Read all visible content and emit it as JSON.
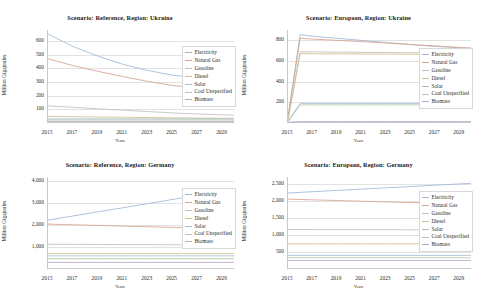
{
  "figure": {
    "xlabel": "Years",
    "ylabel": "Million Gigajoules",
    "xticks": [
      "2015",
      "2017",
      "2019",
      "2021",
      "2023",
      "2025",
      "2027",
      "2029"
    ],
    "legend": [
      {
        "label": "Electricity",
        "color": "#9fb8d8"
      },
      {
        "label": "Natural Gas",
        "color": "#d8a48c"
      },
      {
        "label": "Gasoline",
        "color": "#bfbfbf"
      },
      {
        "label": "Diesel",
        "color": "#cfc08a"
      },
      {
        "label": "Solar",
        "color": "#a8bcd0"
      },
      {
        "label": "Coal Unspecified",
        "color": "#b0c9a8"
      },
      {
        "label": "Biomass",
        "color": "#b9a9c9"
      }
    ]
  },
  "charts": [
    {
      "title": "Scenario: Reference, Region: Ukraine",
      "yticks": [
        "100",
        "200",
        "300",
        "400",
        "500",
        "600"
      ]
    },
    {
      "title": "Scenario: European, Region: Ukraine",
      "yticks": [
        "200",
        "400",
        "600",
        "800"
      ]
    },
    {
      "title": "Scenario: Reference, Region: Germany",
      "yticks": [
        "1,000",
        "2,000",
        "3,000",
        "4,000"
      ]
    },
    {
      "title": "Scenario: European, Region: Germany",
      "yticks": [
        "500",
        "1,000",
        "1,500",
        "2,000",
        "2,500"
      ]
    }
  ],
  "chart_data": [
    {
      "type": "line",
      "title": "Scenario: Reference, Region: Ukraine",
      "xlabel": "Years",
      "ylabel": "Million Gigajoules",
      "x": [
        2015,
        2017,
        2019,
        2021,
        2023,
        2025,
        2027,
        2029,
        2030
      ],
      "ylim": [
        0,
        680
      ],
      "yticks": [
        100,
        200,
        300,
        400,
        500,
        600
      ],
      "grid": true,
      "legend_position": "right",
      "series": [
        {
          "name": "Electricity",
          "values": [
            650,
            560,
            490,
            430,
            385,
            350,
            330,
            318,
            315
          ]
        },
        {
          "name": "Natural Gas",
          "values": [
            470,
            420,
            378,
            340,
            305,
            275,
            258,
            248,
            245
          ]
        },
        {
          "name": "Gasoline",
          "values": [
            125,
            115,
            104,
            94,
            84,
            74,
            66,
            60,
            58
          ]
        },
        {
          "name": "Diesel",
          "values": [
            48,
            46,
            44,
            42,
            40,
            38,
            36,
            35,
            35
          ]
        },
        {
          "name": "Solar",
          "values": [
            30,
            30,
            30,
            30,
            30,
            30,
            30,
            30,
            30
          ]
        },
        {
          "name": "Coal Unspecified",
          "values": [
            22,
            22,
            22,
            22,
            22,
            22,
            22,
            22,
            22
          ]
        },
        {
          "name": "Biomass",
          "values": [
            12,
            12,
            12,
            12,
            12,
            12,
            12,
            12,
            12
          ]
        }
      ]
    },
    {
      "type": "line",
      "title": "Scenario: European, Region: Ukraine",
      "xlabel": "Years",
      "ylabel": "Million Gigajoules",
      "x": [
        2015,
        2016,
        2017,
        2019,
        2021,
        2023,
        2025,
        2027,
        2029,
        2030
      ],
      "ylim": [
        0,
        900
      ],
      "yticks": [
        200,
        400,
        600,
        800
      ],
      "grid": true,
      "legend_position": "right",
      "series": [
        {
          "name": "Electricity",
          "values": [
            60,
            855,
            840,
            820,
            800,
            780,
            760,
            742,
            728,
            722
          ]
        },
        {
          "name": "Natural Gas",
          "values": [
            55,
            820,
            812,
            800,
            788,
            774,
            760,
            746,
            732,
            726
          ]
        },
        {
          "name": "Gasoline",
          "values": [
            40,
            690,
            688,
            686,
            684,
            682,
            680,
            678,
            676,
            675
          ]
        },
        {
          "name": "Diesel",
          "values": [
            30,
            672,
            670,
            669,
            668,
            667,
            666,
            665,
            664,
            663
          ]
        },
        {
          "name": "Solar",
          "values": [
            20,
            190,
            190,
            190,
            190,
            190,
            190,
            190,
            190,
            190
          ]
        },
        {
          "name": "Coal Unspecified",
          "values": [
            14,
            175,
            175,
            175,
            175,
            175,
            175,
            175,
            175,
            175
          ]
        },
        {
          "name": "Biomass",
          "values": [
            8,
            14,
            14,
            14,
            14,
            14,
            14,
            14,
            14,
            14
          ]
        }
      ]
    },
    {
      "type": "line",
      "title": "Scenario: Reference, Region: Germany",
      "xlabel": "Years",
      "ylabel": "Million Gigajoules",
      "x": [
        2015,
        2017,
        2019,
        2021,
        2023,
        2025,
        2027,
        2029,
        2030
      ],
      "ylim": [
        0,
        4200
      ],
      "yticks": [
        1000,
        2000,
        3000,
        4000
      ],
      "grid": true,
      "legend_position": "right",
      "series": [
        {
          "name": "Electricity",
          "values": [
            2230,
            2420,
            2610,
            2790,
            2980,
            3170,
            3360,
            3560,
            3660
          ]
        },
        {
          "name": "Natural Gas",
          "values": [
            2050,
            2020,
            1990,
            1960,
            1930,
            1900,
            1880,
            1865,
            1860
          ]
        },
        {
          "name": "Gasoline",
          "values": [
            1130,
            1125,
            1120,
            1115,
            1110,
            1105,
            1100,
            1098,
            1096
          ]
        },
        {
          "name": "Diesel",
          "values": [
            700,
            700,
            700,
            700,
            700,
            700,
            700,
            700,
            700
          ]
        },
        {
          "name": "Solar",
          "values": [
            600,
            600,
            600,
            600,
            600,
            600,
            600,
            600,
            600
          ]
        },
        {
          "name": "Coal Unspecified",
          "values": [
            470,
            470,
            470,
            470,
            470,
            470,
            470,
            470,
            470
          ]
        },
        {
          "name": "Biomass",
          "values": [
            300,
            300,
            300,
            300,
            300,
            300,
            300,
            300,
            300
          ]
        }
      ]
    },
    {
      "type": "line",
      "title": "Scenario: European, Region: Germany",
      "xlabel": "Years",
      "ylabel": "Million Gigajoules",
      "x": [
        2015,
        2017,
        2019,
        2021,
        2023,
        2025,
        2027,
        2029,
        2030
      ],
      "ylim": [
        0,
        2700
      ],
      "yticks": [
        500,
        1000,
        1500,
        2000,
        2500
      ],
      "grid": true,
      "legend_position": "right",
      "series": [
        {
          "name": "Electricity",
          "values": [
            2230,
            2268,
            2306,
            2344,
            2382,
            2420,
            2458,
            2496,
            2515
          ]
        },
        {
          "name": "Natural Gas",
          "values": [
            2050,
            2030,
            2010,
            1990,
            1970,
            1950,
            1932,
            1916,
            1908
          ]
        },
        {
          "name": "Gasoline",
          "values": [
            1160,
            1158,
            1156,
            1154,
            1152,
            1150,
            1148,
            1146,
            1145
          ]
        },
        {
          "name": "Diesel",
          "values": [
            740,
            740,
            740,
            740,
            740,
            740,
            740,
            740,
            740
          ]
        },
        {
          "name": "Solar",
          "values": [
            400,
            400,
            400,
            400,
            400,
            400,
            400,
            400,
            400
          ]
        },
        {
          "name": "Coal Unspecified",
          "values": [
            330,
            330,
            330,
            330,
            330,
            330,
            330,
            330,
            330
          ]
        },
        {
          "name": "Biomass",
          "values": [
            250,
            250,
            250,
            250,
            250,
            250,
            250,
            250,
            250
          ]
        }
      ]
    }
  ]
}
